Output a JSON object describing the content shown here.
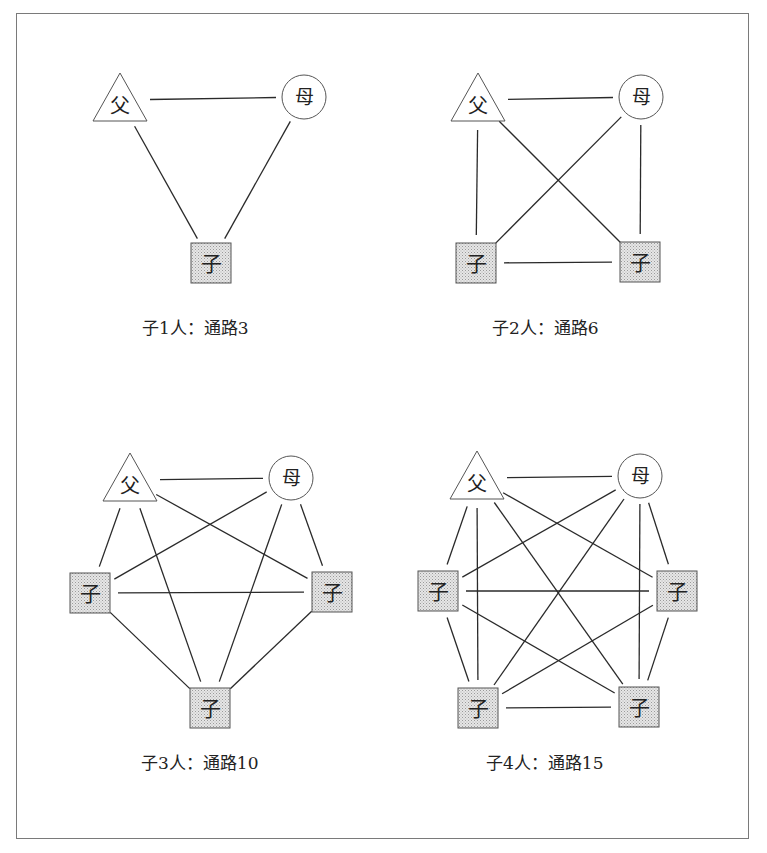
{
  "labels": {
    "father": "父",
    "mother": "母",
    "child": "子"
  },
  "colors": {
    "line": "#2a2a2a",
    "child_fill": "#d8d8d8",
    "frame": "#7a7a7a"
  },
  "panels": [
    {
      "caption": "子1人：通路3",
      "children_count": 1,
      "paths": 3,
      "caption_pos": [
        142,
        314
      ],
      "father": [
        120,
        100
      ],
      "mother": [
        304,
        97
      ],
      "children": [
        [
          211,
          263
        ]
      ]
    },
    {
      "caption": "子2人：通路6",
      "children_count": 2,
      "paths": 6,
      "caption_pos": [
        492,
        314
      ],
      "father": [
        478,
        100
      ],
      "mother": [
        641,
        97
      ],
      "children": [
        [
          476,
          263
        ],
        [
          640,
          262
        ]
      ]
    },
    {
      "caption": "子3人：通路10",
      "children_count": 3,
      "paths": 10,
      "caption_pos": [
        141,
        749
      ],
      "father": [
        130,
        480
      ],
      "mother": [
        291,
        478
      ],
      "children": [
        [
          90,
          593
        ],
        [
          332,
          592
        ],
        [
          210,
          708
        ]
      ]
    },
    {
      "caption": "子4人：通路15",
      "children_count": 4,
      "paths": 15,
      "caption_pos": [
        486,
        749
      ],
      "father": [
        477,
        478
      ],
      "mother": [
        640,
        476
      ],
      "children": [
        [
          438,
          591
        ],
        [
          677,
          591
        ],
        [
          478,
          708
        ],
        [
          639,
          707
        ]
      ]
    }
  ]
}
